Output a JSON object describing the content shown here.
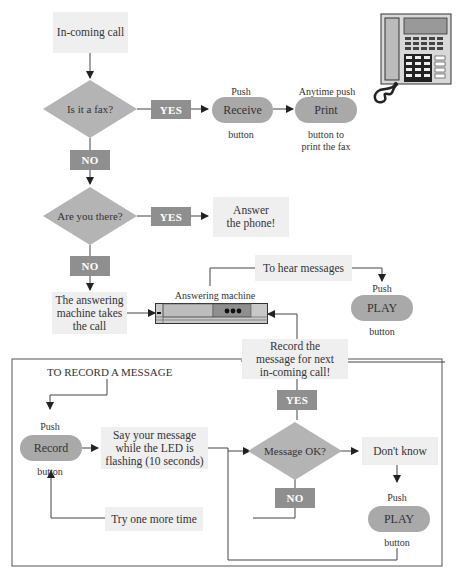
{
  "flow": {
    "incoming_call": "In-coming call",
    "is_fax": "Is it a fax?",
    "yes1": "YES",
    "no1": "NO",
    "receive_push": "Push",
    "receive_button": "Receive",
    "receive_caption": "button",
    "print_push": "Anytime push",
    "print_button": "Print",
    "print_caption_1": "button to",
    "print_caption_2": "print the fax",
    "are_you_there": "Are you there?",
    "yes2": "YES",
    "no2": "NO",
    "answer_phone_1": "Answer",
    "answer_phone_2": "the phone!",
    "machine_takes_1": "The answering",
    "machine_takes_2": "machine takes",
    "machine_takes_3": "the call",
    "answering_machine_label": "Answering machine",
    "to_hear_messages": "To hear messages",
    "play_push": "Push",
    "play_button": "PLAY",
    "play_caption": "button"
  },
  "record_section": {
    "title": "TO RECORD A MESSAGE",
    "record_push": "Push",
    "record_button": "Record",
    "record_caption": "button",
    "say_message_1": "Say your message",
    "say_message_2": "while the LED is",
    "say_message_3": "flashing (10 seconds)",
    "record_next_1": "Record the",
    "record_next_2": "message for next",
    "record_next_3": "in-coming call!",
    "yes": "YES",
    "message_ok": "Message OK?",
    "no": "NO",
    "dont_know": "Don't know",
    "try_again": "Try one more time",
    "play_push": "Push",
    "play_button": "PLAY",
    "play_caption": "button"
  },
  "icons": {
    "telephone": "telephone-icon",
    "answering_machine": "answering-machine-icon"
  },
  "colors": {
    "box_fill": "#efeff0",
    "tag_fill": "#8f8f90",
    "pill_fill": "#a9a9aa",
    "diamond_fill": "#b4b4b5",
    "line": "#333333"
  }
}
